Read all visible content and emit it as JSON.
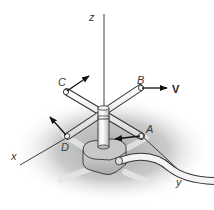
{
  "figure": {
    "axes": {
      "x": "x",
      "y": "y",
      "z": "z"
    },
    "points": {
      "A": "A",
      "B": "B",
      "C": "C",
      "D": "D"
    },
    "velocity_label": "V",
    "colors": {
      "shadow": "#bdbdbd",
      "arm": "#ffffff",
      "outline": "#333333",
      "base": "#cfcfcf"
    }
  }
}
